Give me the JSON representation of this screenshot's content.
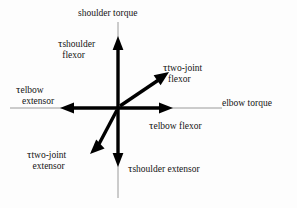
{
  "figure": {
    "background_color": "#fdfdfd",
    "axis_color": "#999999",
    "arrow_color": "#000000",
    "text_color": "#141414"
  },
  "axes": {
    "vertical_label": "shoulder torque",
    "horizontal_label": "elbow torque",
    "origin": {
      "x": 118,
      "y": 108
    }
  },
  "symbols": {
    "tau": "τ"
  },
  "vectors": [
    {
      "id": "shoulder-flexor",
      "symbol": "τ",
      "subscript_line1": "shoulder",
      "subscript_line2": "flexor",
      "direction": "up",
      "tip": {
        "x": 118,
        "y": 38
      }
    },
    {
      "id": "two-joint-flexor",
      "symbol": "τ",
      "subscript_line1": "two-joint",
      "subscript_line2": "flexor",
      "direction": "up-right",
      "tip": {
        "x": 168,
        "y": 72
      }
    },
    {
      "id": "elbow-flexor",
      "symbol": "τ",
      "subscript_line1": "elbow flexor",
      "subscript_line2": "",
      "direction": "right",
      "tip": {
        "x": 172,
        "y": 108
      }
    },
    {
      "id": "shoulder-extensor",
      "symbol": "τ",
      "subscript_line1": "shoulder extensor",
      "subscript_line2": "",
      "direction": "down",
      "tip": {
        "x": 118,
        "y": 166
      }
    },
    {
      "id": "two-joint-extensor",
      "symbol": "τ",
      "subscript_line1": "two-joint",
      "subscript_line2": "extensor",
      "direction": "down-left",
      "tip": {
        "x": 91,
        "y": 153
      }
    },
    {
      "id": "elbow-extensor",
      "symbol": "τ",
      "subscript_line1": "elbow",
      "subscript_line2": "extensor",
      "direction": "left",
      "tip": {
        "x": 61,
        "y": 108
      }
    }
  ]
}
